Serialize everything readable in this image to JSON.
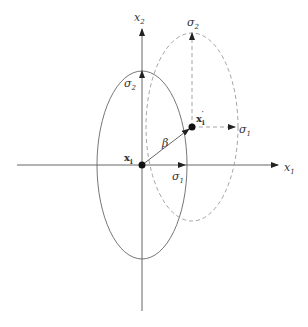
{
  "diagram": {
    "type": "gaussian-ellipse-shift",
    "colors": {
      "line": "#555555",
      "dashed": "#888888",
      "text": "#333333",
      "point": "#111111",
      "background": "#ffffff"
    },
    "axes": {
      "x_label": "x",
      "x_label_sub": "1",
      "y_label": "x",
      "y_label_sub": "2"
    },
    "original": {
      "point_label": "x",
      "point_label_sub": "i",
      "sigma1_label": "σ",
      "sigma1_sub": "1",
      "sigma2_label": "σ",
      "sigma2_sub": "2",
      "style": "solid"
    },
    "shifted": {
      "point_label": "x",
      "point_label_sub": "i",
      "point_label_prime": "′",
      "sigma1_label": "σ",
      "sigma1_sub": "1",
      "sigma2_label": "σ",
      "sigma2_sub": "2",
      "style": "dashed"
    },
    "displacement": {
      "label": "β"
    }
  }
}
